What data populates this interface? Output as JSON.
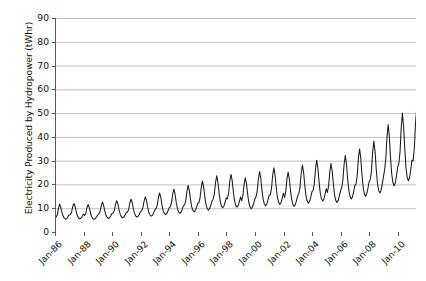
{
  "chart_data": {
    "type": "line",
    "title": "",
    "xlabel": "",
    "ylabel": "Electricity Produced by Hydropower (tWhr)",
    "ylim": [
      0,
      90
    ],
    "ytick_step": 10,
    "yticks": [
      "0",
      "10",
      "20",
      "30",
      "40",
      "50",
      "60",
      "70",
      "80",
      "90"
    ],
    "xticks": [
      "Jan-86",
      "Jan-88",
      "Jan-90",
      "Jan-92",
      "Jan-94",
      "Jan-96",
      "Jan-98",
      "Jan-00",
      "Jan-02",
      "Jan-04",
      "Jan-06",
      "Jan-08",
      "Jan-10"
    ],
    "x_start_label": "Jan-86",
    "x_end_label": "Jan-10",
    "x_tick_interval_years": 2,
    "grid": "horizontal",
    "legend": "none",
    "line_color": "#1a1a1a",
    "grid_color": "#b8b8b8",
    "axis_color": "#5a5a5a",
    "series": [
      {
        "name": "Electricity Produced by Hydropower",
        "frequency": "monthly",
        "units": "tWhr",
        "values": [
          6.2,
          7.0,
          9.6,
          11.8,
          10.4,
          8.2,
          6.6,
          5.8,
          5.4,
          5.6,
          6.4,
          7.2,
          7.4,
          8.2,
          10.6,
          12.0,
          10.8,
          8.6,
          6.8,
          5.9,
          5.5,
          5.8,
          6.6,
          7.5,
          7.0,
          7.8,
          10.2,
          11.6,
          10.2,
          8.0,
          6.4,
          5.6,
          5.3,
          5.6,
          6.3,
          7.1,
          7.6,
          8.6,
          11.0,
          12.6,
          11.2,
          8.8,
          7.0,
          6.1,
          5.7,
          6.0,
          6.8,
          7.8,
          8.0,
          9.0,
          11.6,
          13.2,
          11.8,
          9.2,
          7.4,
          6.4,
          6.0,
          6.3,
          7.1,
          8.2,
          8.4,
          9.4,
          12.2,
          13.8,
          12.4,
          9.6,
          7.8,
          6.7,
          6.3,
          6.6,
          7.5,
          8.6,
          9.0,
          10.2,
          13.0,
          14.8,
          13.2,
          10.4,
          8.2,
          7.1,
          6.7,
          7.0,
          8.0,
          9.2,
          9.8,
          11.2,
          14.4,
          16.4,
          14.6,
          11.4,
          9.0,
          7.8,
          7.3,
          7.7,
          8.8,
          10.1,
          10.6,
          12.2,
          15.8,
          18.0,
          16.0,
          12.4,
          9.8,
          8.4,
          7.9,
          8.3,
          9.5,
          11.0,
          11.4,
          13.2,
          17.2,
          19.6,
          17.4,
          13.6,
          10.6,
          9.1,
          8.5,
          9.0,
          10.3,
          11.9,
          12.4,
          14.4,
          18.8,
          21.4,
          19.0,
          14.8,
          11.6,
          9.9,
          9.2,
          9.8,
          11.2,
          13.0,
          13.8,
          16.0,
          20.8,
          23.6,
          21.0,
          16.4,
          12.8,
          10.9,
          10.2,
          10.8,
          12.4,
          14.3,
          14.0,
          16.4,
          21.4,
          24.2,
          21.6,
          16.8,
          13.1,
          11.2,
          10.4,
          11.1,
          12.7,
          14.7,
          13.2,
          15.4,
          20.0,
          22.8,
          20.2,
          15.8,
          12.3,
          10.5,
          9.8,
          10.4,
          11.9,
          13.8,
          14.8,
          17.2,
          22.4,
          25.4,
          22.6,
          17.6,
          13.8,
          11.8,
          11.0,
          11.7,
          13.4,
          15.5,
          15.6,
          18.2,
          23.8,
          27.0,
          24.0,
          18.7,
          14.6,
          12.5,
          11.6,
          12.3,
          14.1,
          16.3,
          14.6,
          17.0,
          22.2,
          25.2,
          22.4,
          17.4,
          13.6,
          11.6,
          10.8,
          11.5,
          13.2,
          15.2,
          16.2,
          19.0,
          24.8,
          28.2,
          25.0,
          19.5,
          15.2,
          13.0,
          12.1,
          12.8,
          14.7,
          17.0,
          17.4,
          20.4,
          26.6,
          30.2,
          26.8,
          20.9,
          16.3,
          13.9,
          13.0,
          13.8,
          15.8,
          18.2,
          16.6,
          19.4,
          25.4,
          28.8,
          25.6,
          20.0,
          15.6,
          13.3,
          12.4,
          13.2,
          15.1,
          17.4,
          18.6,
          21.8,
          28.4,
          32.2,
          28.6,
          22.3,
          17.4,
          14.9,
          13.9,
          14.7,
          16.9,
          19.5,
          20.2,
          23.6,
          30.8,
          35.0,
          31.0,
          24.2,
          18.9,
          16.1,
          15.0,
          16.0,
          18.3,
          21.1,
          22.0,
          25.8,
          33.6,
          38.2,
          33.9,
          26.4,
          20.6,
          17.6,
          16.4,
          17.4,
          20.0,
          23.1,
          26.0,
          30.6,
          39.8,
          45.2,
          40.1,
          31.2,
          24.4,
          20.8,
          19.4,
          20.6,
          23.6,
          27.3,
          28.8,
          33.8,
          44.0,
          50.0,
          44.4,
          34.6,
          27.0,
          23.0,
          21.5,
          22.8,
          26.2,
          30.2,
          30.0,
          35.2,
          45.8,
          52.0,
          46.2,
          36.0,
          38.0,
          33.6,
          26.0,
          24.8,
          28.4,
          32.8,
          33.6,
          39.4,
          51.2,
          58.2,
          51.7,
          40.3,
          31.4,
          26.8,
          25.0,
          26.5,
          30.4,
          35.1,
          38.6,
          45.2,
          58.8,
          66.8,
          59.3,
          46.2,
          36.1,
          30.8,
          28.7,
          30.4,
          34.9,
          40.3,
          34.0,
          39.8,
          51.8,
          58.8,
          52.2,
          40.7,
          31.8,
          27.1,
          25.3,
          26.8,
          30.8,
          35.5,
          47.4,
          55.6,
          72.4,
          82.2,
          73.0,
          56.9,
          44.4,
          37.9,
          35.3,
          37.4,
          43.0,
          49.6,
          34.5,
          33.0,
          38.2,
          40.0,
          37.5,
          38.6
        ]
      }
    ]
  }
}
